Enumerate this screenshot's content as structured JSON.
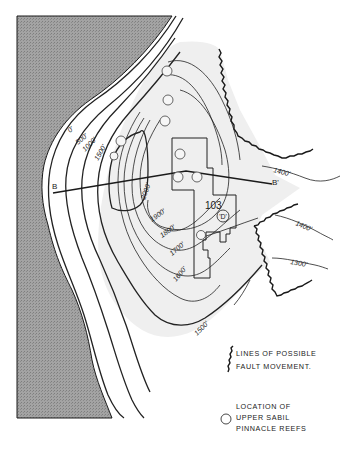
{
  "map": {
    "contour_labels": [
      {
        "id": "c0",
        "text": "0'"
      },
      {
        "id": "c500",
        "text": "500'"
      },
      {
        "id": "c1000",
        "text": "1000'"
      },
      {
        "id": "c1500",
        "text": "1500'"
      },
      {
        "id": "c2000",
        "text": "2000'"
      },
      {
        "id": "c1900",
        "text": "1900'"
      },
      {
        "id": "c1800",
        "text": "1800'"
      },
      {
        "id": "c1700",
        "text": "1700'"
      },
      {
        "id": "c1600",
        "text": "1600'"
      },
      {
        "id": "c1500b",
        "text": "1500'"
      },
      {
        "id": "c1400a",
        "text": "1400'"
      },
      {
        "id": "c1400b",
        "text": "1400'"
      },
      {
        "id": "c1300",
        "text": "1300'"
      }
    ],
    "section_line": {
      "start_label": "B",
      "end_label": "B'"
    },
    "block_label": "103",
    "well_marker_label": "'D'",
    "colors": {
      "basement": "#9a9a9a",
      "field": "#efefef",
      "line": "#222222"
    }
  },
  "legend": {
    "fault_label_line1": "LINES OF POSSIBLE",
    "fault_label_line2": "FAULT MOVEMENT.",
    "reef_label_line1": "LOCATION OF",
    "reef_label_line2": "UPPER SABIL",
    "reef_label_line3": "PINNACLE REEFS"
  }
}
